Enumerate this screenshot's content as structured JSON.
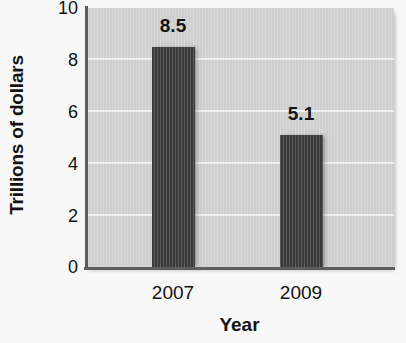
{
  "chart_data": {
    "type": "bar",
    "title": "",
    "categories": [
      "2007",
      "2009"
    ],
    "values": [
      8.5,
      5.1
    ],
    "data_labels": [
      "8.5",
      "5.1"
    ],
    "xlabel": "Year",
    "ylabel": "Trillions of dollars",
    "ylim": [
      0,
      10
    ],
    "yticks": [
      0,
      2,
      4,
      6,
      8,
      10
    ],
    "ytick_labels": [
      "0",
      "2",
      "4",
      "6",
      "8",
      "10"
    ],
    "grid": true,
    "grid_axis": "y",
    "legend": false,
    "legend_position": "none",
    "orientation": "vertical"
  },
  "style": {
    "page_background": "#f8f8f8",
    "plot_background": "#cfcfcf",
    "bar_color": "#3a3a3a",
    "gridline_color": "#f1f1f1",
    "axis_color": "#5d5d5d",
    "text_color": "#111111"
  }
}
